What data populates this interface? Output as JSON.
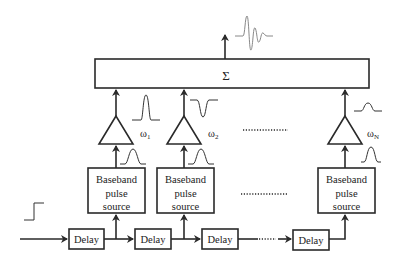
{
  "diagram": {
    "title": "",
    "summer": {
      "symbol": "Σ",
      "label": "summer"
    },
    "output": {
      "waveform": "ultra-wideband-pulse"
    },
    "input": {
      "waveform": "step"
    },
    "branches": [
      {
        "id": "1",
        "source_label": [
          "Baseband",
          "pulse",
          "source"
        ],
        "carrier_symbol": "ω",
        "carrier_index": "1",
        "source_pulse": "gaussian-positive",
        "modulated_pulse": "gaussian-positive"
      },
      {
        "id": "2",
        "source_label": [
          "Baseband",
          "pulse",
          "source"
        ],
        "carrier_symbol": "ω",
        "carrier_index": "2",
        "source_pulse": "gaussian-positive",
        "modulated_pulse": "gaussian-negative"
      },
      {
        "id": "N",
        "source_label": [
          "Baseband",
          "pulse",
          "source"
        ],
        "carrier_symbol": "ω",
        "carrier_index": "N",
        "source_pulse": "gaussian-positive",
        "modulated_pulse": "gaussian-small"
      }
    ],
    "delays": [
      "Delay",
      "Delay",
      "Delay",
      "Delay"
    ],
    "ellipsis_between_branches": true,
    "ellipsis_in_delay_chain": true
  },
  "colors": {
    "line": "#2a2a2a",
    "output_wave": "#888888",
    "background": "#ffffff"
  }
}
